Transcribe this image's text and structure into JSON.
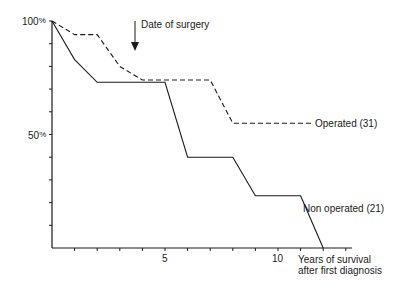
{
  "chart_data": {
    "type": "line",
    "title": "",
    "xlabel": "Years of survival after first diagnosis",
    "xlabel_lines": [
      "Years of survival",
      "after first diagnosis"
    ],
    "ylabel": "",
    "xlim": [
      0,
      13
    ],
    "ylim": [
      0,
      100
    ],
    "x_tick_labels": [
      {
        "x": 5,
        "label": "5"
      },
      {
        "x": 10,
        "label": "10"
      }
    ],
    "y_tick_labels": [
      {
        "y": 100,
        "label": "100%"
      },
      {
        "y": 50,
        "label": "50%"
      }
    ],
    "x_minor_ticks": [
      1,
      2,
      3,
      4,
      5,
      6,
      7,
      8,
      9,
      10,
      11,
      12,
      13
    ],
    "y_minor_ticks": [
      10,
      20,
      30,
      40,
      50,
      60,
      70,
      80,
      90,
      100
    ],
    "grid": false,
    "legend_position": "inline labels at line ends",
    "annotation": {
      "text": "Date of surgery",
      "arrow_x": 3.6,
      "note": "downward arrow"
    },
    "series": [
      {
        "name": "Operated (31)",
        "style": "dashed",
        "x": [
          0,
          1,
          2,
          3,
          4,
          7,
          8,
          11.5
        ],
        "values": [
          100,
          94,
          94,
          80,
          74,
          74,
          55,
          55
        ]
      },
      {
        "name": "Non operated (21)",
        "style": "solid",
        "x": [
          0,
          1,
          2,
          5,
          6,
          8,
          9,
          11,
          12
        ],
        "values": [
          100,
          83,
          73,
          73,
          40,
          40,
          23,
          23,
          0
        ]
      }
    ]
  },
  "labels": {
    "y100": "100",
    "y50": "50",
    "pct": "%",
    "x5": "5",
    "x10": "10",
    "xlabel1": "Years of survival",
    "xlabel2": "after first diagnosis",
    "annotation": "Date of surgery",
    "operated": "Operated (31)",
    "non_operated": "Non operated (21)"
  }
}
